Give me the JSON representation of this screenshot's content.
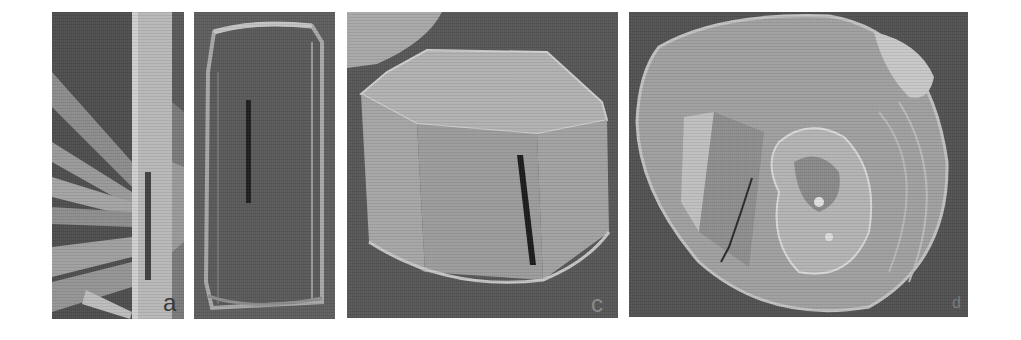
{
  "figure": {
    "panels": [
      {
        "id": "a",
        "label": "a",
        "subject": "rod-shaped crystals with scale bar",
        "label_color": "#3a3a3a"
      },
      {
        "id": "b",
        "label": "",
        "subject": "prismatic crystal, side view with scale bar"
      },
      {
        "id": "c",
        "label": "c",
        "subject": "hexagonal prism crystal with scale bar",
        "label_color": "#8a8a8a"
      },
      {
        "id": "d",
        "label": "d",
        "subject": "rounded aggregated crystal with scale bar",
        "label_color": "#7a7a7a"
      }
    ],
    "colors": {
      "background": "#ffffff",
      "scale_bar": "#1a1a1a"
    }
  }
}
